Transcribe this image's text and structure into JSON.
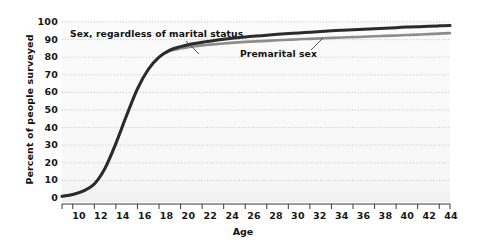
{
  "chart_data": {
    "type": "line",
    "title": "",
    "xlabel": "Age",
    "ylabel": "Percent of people surveyed",
    "xlim": [
      9,
      45
    ],
    "ylim": [
      0,
      100
    ],
    "grid": "horizontal-dotted",
    "legend": "inline-annotations",
    "xticks": [
      10,
      12,
      14,
      16,
      18,
      20,
      22,
      24,
      26,
      28,
      30,
      32,
      34,
      36,
      38,
      40,
      42,
      44
    ],
    "yticks": [
      0,
      10,
      20,
      30,
      40,
      50,
      60,
      70,
      80,
      90,
      100
    ],
    "x": [
      9,
      10,
      11,
      12,
      13,
      14,
      15,
      16,
      17,
      18,
      19,
      20,
      21,
      22,
      23,
      24,
      25,
      26,
      27,
      28,
      29,
      30,
      31,
      32,
      33,
      34,
      35,
      36,
      37,
      38,
      39,
      40,
      41,
      42,
      43,
      44,
      45
    ],
    "series": [
      {
        "name": "Sex, regardless of marital status",
        "color": "#2b2b2b",
        "values": [
          1,
          2,
          4,
          8,
          17,
          31,
          47,
          62,
          73,
          80,
          84,
          86,
          87.5,
          88.5,
          89.4,
          90.2,
          90.9,
          91.5,
          92,
          92.5,
          93,
          93.4,
          93.8,
          94.2,
          94.6,
          95,
          95.3,
          95.6,
          95.9,
          96.2,
          96.5,
          96.8,
          97.1,
          97.3,
          97.6,
          97.8,
          98
        ]
      },
      {
        "name": "Premarital sex",
        "color": "#8c8c8c",
        "values": [
          1,
          2,
          4,
          8,
          17,
          31,
          47,
          62,
          73,
          80,
          83.5,
          85,
          86,
          86.7,
          87.3,
          87.8,
          88.3,
          88.7,
          89,
          89.3,
          89.6,
          89.9,
          90.2,
          90.4,
          90.7,
          91,
          91.2,
          91.4,
          91.6,
          91.9,
          92.1,
          92.3,
          92.6,
          92.8,
          93.1,
          93.4,
          93.7
        ]
      }
    ],
    "annotations": [
      {
        "id": "sex",
        "text": "Sex, regardless of marital status",
        "target_x": 20,
        "target_y": 85
      },
      {
        "id": "premarital",
        "text": "Premarital sex",
        "target_x": 22.5,
        "target_y": 86.5
      }
    ]
  },
  "axes": {
    "y_title": "Percent of people surveyed",
    "x_title": "Age",
    "y_tick_labels": [
      "100",
      "90",
      "80",
      "70",
      "60",
      "50",
      "40",
      "30",
      "20",
      "10",
      "0"
    ],
    "x_tick_labels": [
      "10",
      "12",
      "14",
      "16",
      "18",
      "20",
      "22",
      "24",
      "26",
      "28",
      "30",
      "32",
      "34",
      "36",
      "38",
      "40",
      "42",
      "44"
    ]
  },
  "annotations": {
    "sex_label": "Sex, regardless of marital status",
    "premarital_label": "Premarital sex"
  },
  "colors": {
    "series_dark": "#2b2b2b",
    "series_light": "#8c8c8c",
    "grid": "#b9b9b9",
    "axis": "#3a3a3a",
    "plot_bg": "#f8f8f8",
    "text": "#111111"
  }
}
